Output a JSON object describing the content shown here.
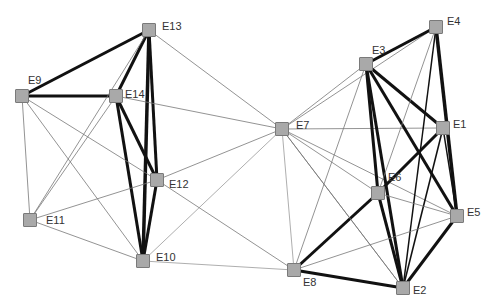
{
  "diagram": {
    "type": "network-graph",
    "colors": {
      "node_fill": "#a9a9a9",
      "node_border": "#7a7a7a",
      "edge_strong": "#111111",
      "edge_weak": "#777777",
      "label": "#333333"
    },
    "nodes": [
      {
        "id": "E1",
        "x": 443,
        "y": 128,
        "lx": 10,
        "ly": -10
      },
      {
        "id": "E2",
        "x": 403,
        "y": 288,
        "lx": 10,
        "ly": -4
      },
      {
        "id": "E3",
        "x": 366,
        "y": 64,
        "lx": 6,
        "ly": -20
      },
      {
        "id": "E4",
        "x": 436,
        "y": 27,
        "lx": 11,
        "ly": -12
      },
      {
        "id": "E5",
        "x": 457,
        "y": 216,
        "lx": 10,
        "ly": -10
      },
      {
        "id": "E6",
        "x": 378,
        "y": 193,
        "lx": 10,
        "ly": -22
      },
      {
        "id": "E7",
        "x": 282,
        "y": 129,
        "lx": 14,
        "ly": -10
      },
      {
        "id": "E8",
        "x": 294,
        "y": 270,
        "lx": 9,
        "ly": 6
      },
      {
        "id": "E9",
        "x": 22,
        "y": 96,
        "lx": 6,
        "ly": -22
      },
      {
        "id": "E10",
        "x": 143,
        "y": 261,
        "lx": 13,
        "ly": -10
      },
      {
        "id": "E11",
        "x": 30,
        "y": 220,
        "lx": 16,
        "ly": -6
      },
      {
        "id": "E12",
        "x": 157,
        "y": 180,
        "lx": 12,
        "ly": -2
      },
      {
        "id": "E13",
        "x": 149,
        "y": 30,
        "lx": 13,
        "ly": -10
      },
      {
        "id": "E14",
        "x": 116,
        "y": 96,
        "lx": 9,
        "ly": -8
      }
    ],
    "edges": [
      {
        "a": "E9",
        "b": "E13",
        "w": 3
      },
      {
        "a": "E9",
        "b": "E14",
        "w": 3
      },
      {
        "a": "E13",
        "b": "E14",
        "w": 3
      },
      {
        "a": "E13",
        "b": "E12",
        "w": 3
      },
      {
        "a": "E13",
        "b": "E10",
        "w": 3.5
      },
      {
        "a": "E14",
        "b": "E12",
        "w": 3
      },
      {
        "a": "E14",
        "b": "E10",
        "w": 3
      },
      {
        "a": "E12",
        "b": "E10",
        "w": 3
      },
      {
        "a": "E13",
        "b": "E11",
        "w": 0.8
      },
      {
        "a": "E14",
        "b": "E11",
        "w": 0.8
      },
      {
        "a": "E13",
        "b": "E7",
        "w": 0.8
      },
      {
        "a": "E14",
        "b": "E7",
        "w": 0.8
      },
      {
        "a": "E9",
        "b": "E11",
        "w": 0.8
      },
      {
        "a": "E9",
        "b": "E12",
        "w": 0.8
      },
      {
        "a": "E9",
        "b": "E10",
        "w": 0.8
      },
      {
        "a": "E11",
        "b": "E12",
        "w": 0.8
      },
      {
        "a": "E11",
        "b": "E10",
        "w": 0.8
      },
      {
        "a": "E12",
        "b": "E7",
        "w": 0.8
      },
      {
        "a": "E12",
        "b": "E8",
        "w": 0.8
      },
      {
        "a": "E10",
        "b": "E7",
        "w": 0.6
      },
      {
        "a": "E10",
        "b": "E8",
        "w": 0.6
      },
      {
        "a": "E7",
        "b": "E3",
        "w": 0.8
      },
      {
        "a": "E7",
        "b": "E4",
        "w": 0.8
      },
      {
        "a": "E7",
        "b": "E1",
        "w": 0.8
      },
      {
        "a": "E7",
        "b": "E6",
        "w": 0.8
      },
      {
        "a": "E7",
        "b": "E5",
        "w": 0.8
      },
      {
        "a": "E7",
        "b": "E2",
        "w": 0.8
      },
      {
        "a": "E7",
        "b": "E8",
        "w": 0.6
      },
      {
        "a": "E3",
        "b": "E4",
        "w": 3
      },
      {
        "a": "E3",
        "b": "E1",
        "w": 3
      },
      {
        "a": "E3",
        "b": "E6",
        "w": 3
      },
      {
        "a": "E3",
        "b": "E2",
        "w": 3
      },
      {
        "a": "E3",
        "b": "E5",
        "w": 3
      },
      {
        "a": "E3",
        "b": "E8",
        "w": 0.8
      },
      {
        "a": "E4",
        "b": "E5",
        "w": 3.5
      },
      {
        "a": "E4",
        "b": "E2",
        "w": 1.5
      },
      {
        "a": "E4",
        "b": "E6",
        "w": 0.8
      },
      {
        "a": "E1",
        "b": "E6",
        "w": 3
      },
      {
        "a": "E1",
        "b": "E2",
        "w": 1.5
      },
      {
        "a": "E1",
        "b": "E5",
        "w": 1.5
      },
      {
        "a": "E6",
        "b": "E2",
        "w": 3
      },
      {
        "a": "E6",
        "b": "E5",
        "w": 0.8
      },
      {
        "a": "E6",
        "b": "E8",
        "w": 3
      },
      {
        "a": "E8",
        "b": "E2",
        "w": 3
      },
      {
        "a": "E8",
        "b": "E5",
        "w": 0.8
      },
      {
        "a": "E5",
        "b": "E2",
        "w": 3
      },
      {
        "a": "E7",
        "b": "E2",
        "w": 0.8
      }
    ]
  }
}
